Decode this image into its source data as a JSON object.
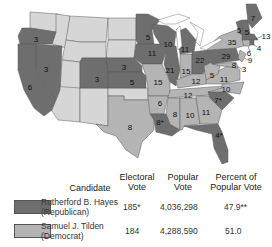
{
  "map": {
    "title": "Election of 1876",
    "colors": {
      "republican": "#6e6e6e",
      "democrat": "#b4b4b4",
      "territory": "#d6d6d6"
    },
    "state_labels": [
      {
        "state": "Oregon",
        "ev": "3",
        "party": "republican"
      },
      {
        "state": "California",
        "ev": "6",
        "party": "republican"
      },
      {
        "state": "Nevada",
        "ev": "3",
        "party": "republican"
      },
      {
        "state": "Colorado",
        "ev": "3",
        "party": "republican"
      },
      {
        "state": "Nebraska",
        "ev": "3",
        "party": "republican"
      },
      {
        "state": "Kansas",
        "ev": "5",
        "party": "republican"
      },
      {
        "state": "Texas",
        "ev": "8",
        "party": "democrat"
      },
      {
        "state": "Minnesota",
        "ev": "5",
        "party": "republican"
      },
      {
        "state": "Iowa",
        "ev": "11",
        "party": "republican"
      },
      {
        "state": "Missouri",
        "ev": "15",
        "party": "democrat"
      },
      {
        "state": "Arkansas",
        "ev": "6",
        "party": "democrat"
      },
      {
        "state": "Louisiana",
        "ev": "8*",
        "party": "republican"
      },
      {
        "state": "Wisconsin",
        "ev": "10",
        "party": "republican"
      },
      {
        "state": "Illinois",
        "ev": "21",
        "party": "republican"
      },
      {
        "state": "Michigan",
        "ev": "11",
        "party": "republican"
      },
      {
        "state": "Indiana",
        "ev": "15",
        "party": "democrat"
      },
      {
        "state": "Ohio",
        "ev": "22",
        "party": "republican"
      },
      {
        "state": "Kentucky",
        "ev": "12",
        "party": "democrat"
      },
      {
        "state": "Tennessee",
        "ev": "12",
        "party": "democrat"
      },
      {
        "state": "Mississippi",
        "ev": "8",
        "party": "democrat"
      },
      {
        "state": "Alabama",
        "ev": "10",
        "party": "democrat"
      },
      {
        "state": "Georgia",
        "ev": "11",
        "party": "democrat"
      },
      {
        "state": "South Carolina",
        "ev": "7*",
        "party": "republican"
      },
      {
        "state": "Florida",
        "ev": "4*",
        "party": "republican"
      },
      {
        "state": "North Carolina",
        "ev": "10",
        "party": "democrat"
      },
      {
        "state": "Virginia",
        "ev": "11",
        "party": "democrat"
      },
      {
        "state": "West Virginia",
        "ev": "5",
        "party": "democrat"
      },
      {
        "state": "Pennsylvania",
        "ev": "29",
        "party": "republican"
      },
      {
        "state": "New York",
        "ev": "35",
        "party": "democrat"
      },
      {
        "state": "Vermont",
        "ev": "5",
        "party": "republican"
      },
      {
        "state": "New Hampshire",
        "ev": "5",
        "party": "republican"
      },
      {
        "state": "Maine",
        "ev": "7",
        "party": "republican"
      },
      {
        "state": "Massachusetts",
        "ev": "13",
        "party": "republican"
      },
      {
        "state": "Rhode Island",
        "ev": "4",
        "party": "republican"
      },
      {
        "state": "Connecticut",
        "ev": "6",
        "party": "democrat"
      },
      {
        "state": "New Jersey",
        "ev": "9",
        "party": "democrat"
      },
      {
        "state": "Delaware",
        "ev": "3",
        "party": "democrat"
      },
      {
        "state": "Maryland",
        "ev": "8",
        "party": "democrat"
      }
    ]
  },
  "legend": {
    "headers": {
      "candidate": "Candidate",
      "electoral_1": "Electoral",
      "electoral_2": "Vote",
      "popular_1": "Popular",
      "popular_2": "Vote",
      "percent_1": "Percent of",
      "percent_2": "Popular Vote"
    },
    "rows": [
      {
        "name": "Rutherford B. Hayes",
        "party": "(Republican)",
        "electoral": "185*",
        "popular": "4,036,298",
        "percent": "47.9**",
        "color": "#6e6e6e"
      },
      {
        "name": "Samuel J. Tilden",
        "party": "(Democrat)",
        "electoral": "184",
        "popular": "4,288,590",
        "percent": "51.0",
        "color": "#b4b4b4"
      }
    ]
  }
}
